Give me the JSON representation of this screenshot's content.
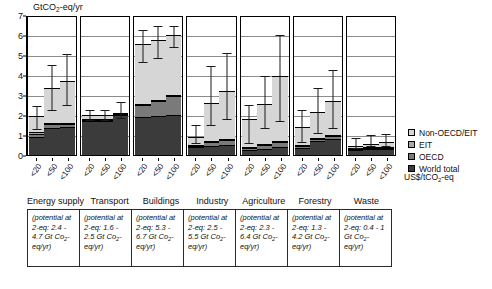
{
  "chart_data": {
    "type": "bar",
    "title": "",
    "ylabel": "GtCO2-eq/yr",
    "xlabel": "US$/tCO2-eq",
    "ylim": [
      0,
      7
    ],
    "yticks": [
      0,
      1,
      2,
      3,
      4,
      5,
      6,
      7
    ],
    "grid": true,
    "legend_position": "right",
    "stacked": true,
    "categories": [
      "<20",
      "<50",
      "<100"
    ],
    "legend": [
      "Non-OECD/EIT",
      "EIT",
      "OECD",
      "World total"
    ],
    "series_colors": {
      "non_oecd_eit": "#d6d6d6",
      "eit": "#a8a8a8",
      "oecd": "#7a7a7a",
      "world_total": "#3b3b3b"
    },
    "panels": [
      {
        "name": "Energy supply",
        "note": "(potential at <US$100/tCO2-eq: 2.4 - 4.7 Gt Co2-eq/yr)",
        "bars": [
          {
            "x": "<20",
            "world_total": 0.9,
            "oecd": 0.15,
            "eit": 0.1,
            "non_oecd_eit": 0.8,
            "total": 1.95,
            "err_low": 1.25,
            "err_high": 2.4
          },
          {
            "x": "<50",
            "world_total": 1.35,
            "oecd": 0.2,
            "eit": 0.05,
            "non_oecd_eit": 1.75,
            "total": 3.35,
            "err_low": 2.2,
            "err_high": 4.45
          },
          {
            "x": "<100",
            "world_total": 1.4,
            "oecd": 0.15,
            "eit": 0.05,
            "non_oecd_eit": 2.1,
            "total": 3.7,
            "err_low": 2.45,
            "err_high": 5.0
          }
        ]
      },
      {
        "name": "Transport",
        "note": "(potential at <US$100/tCO2-eq: 1.6 - 2.5 Gt Co2-eq/yr)",
        "bars": [
          {
            "x": "<20",
            "world_total": 1.7,
            "oecd": 0.05,
            "eit": 0.03,
            "non_oecd_eit": 0.22,
            "total": 2.0,
            "err_low": 1.72,
            "err_high": 2.22
          },
          {
            "x": "<50",
            "world_total": 1.72,
            "oecd": 0.05,
            "eit": 0.03,
            "non_oecd_eit": 0.2,
            "total": 2.0,
            "err_low": 1.72,
            "err_high": 2.22
          },
          {
            "x": "<100",
            "world_total": 2.0,
            "oecd": 0.05,
            "eit": 0.03,
            "non_oecd_eit": 0.0,
            "total": 2.08,
            "err_low": 1.78,
            "err_high": 2.6
          }
        ]
      },
      {
        "name": "Buildings",
        "note": "(potential at <US$100/tCO2-eq: 5.3 - 6.7 Gt Co2-eq/yr)",
        "bars": [
          {
            "x": "<20",
            "world_total": 1.88,
            "oecd": 0.6,
            "eit": 0.05,
            "non_oecd_eit": 3.02,
            "total": 5.55,
            "err_low": 4.62,
            "err_high": 6.22
          },
          {
            "x": "<50",
            "world_total": 1.95,
            "oecd": 0.75,
            "eit": 0.05,
            "non_oecd_eit": 3.0,
            "total": 5.75,
            "err_low": 4.78,
            "err_high": 6.38
          },
          {
            "x": "<100",
            "world_total": 1.98,
            "oecd": 0.95,
            "eit": 0.05,
            "non_oecd_eit": 3.02,
            "total": 6.0,
            "err_low": 5.35,
            "err_high": 6.4
          }
        ]
      },
      {
        "name": "Industry",
        "note": "(potential at <US$100/tCO2-eq: 2.5 - 5.5 Gt Co2-eq/yr)",
        "bars": [
          {
            "x": "<20",
            "world_total": 0.38,
            "oecd": 0.08,
            "eit": 0.04,
            "non_oecd_eit": 0.42,
            "total": 0.92,
            "err_low": 0.55,
            "err_high": 1.45
          },
          {
            "x": "<50",
            "world_total": 0.45,
            "oecd": 0.18,
            "eit": 0.05,
            "non_oecd_eit": 1.92,
            "total": 2.6,
            "err_low": 1.45,
            "err_high": 4.42
          },
          {
            "x": "<100",
            "world_total": 0.48,
            "oecd": 0.25,
            "eit": 0.05,
            "non_oecd_eit": 2.42,
            "total": 3.2,
            "err_low": 1.75,
            "err_high": 5.05
          }
        ]
      },
      {
        "name": "Agriculture",
        "note": "(potential at <US$100/tCO2-eq: 2.3 - 6.4 Gt Co2-eq/yr)",
        "bars": [
          {
            "x": "<20",
            "world_total": 0.25,
            "oecd": 0.1,
            "eit": 0.05,
            "non_oecd_eit": 1.38,
            "total": 1.78,
            "err_low": 0.55,
            "err_high": 2.45
          },
          {
            "x": "<50",
            "world_total": 0.3,
            "oecd": 0.18,
            "eit": 0.05,
            "non_oecd_eit": 2.02,
            "total": 2.55,
            "err_low": 1.32,
            "err_high": 3.88
          },
          {
            "x": "<100",
            "world_total": 0.4,
            "oecd": 0.25,
            "eit": 0.05,
            "non_oecd_eit": 3.25,
            "total": 3.95,
            "err_low": 1.65,
            "err_high": 5.95
          }
        ]
      },
      {
        "name": "Forestry",
        "note": "(potential at <US$100/tCO2-eq: 1.3 - 4.2 Gt Co2-eq/yr)",
        "bars": [
          {
            "x": "<20",
            "world_total": 0.35,
            "oecd": 0.08,
            "eit": 0.05,
            "non_oecd_eit": 0.9,
            "total": 1.38,
            "err_low": 0.62,
            "err_high": 2.18
          },
          {
            "x": "<50",
            "world_total": 0.7,
            "oecd": 0.12,
            "eit": 0.05,
            "non_oecd_eit": 1.28,
            "total": 2.15,
            "err_low": 1.05,
            "err_high": 3.28
          },
          {
            "x": "<100",
            "world_total": 0.82,
            "oecd": 0.15,
            "eit": 0.05,
            "non_oecd_eit": 1.68,
            "total": 2.7,
            "err_low": 1.3,
            "err_high": 4.2
          }
        ]
      },
      {
        "name": "Waste",
        "note": "(potential at <US$100/tCO2-eq: 0.4 - 1 Gt Co2-eq/yr)",
        "bars": [
          {
            "x": "<20",
            "world_total": 0.28,
            "oecd": 0.05,
            "eit": 0.03,
            "non_oecd_eit": 0.1,
            "total": 0.46,
            "err_low": 0.28,
            "err_high": 0.82
          },
          {
            "x": "<50",
            "world_total": 0.3,
            "oecd": 0.06,
            "eit": 0.03,
            "non_oecd_eit": 0.17,
            "total": 0.56,
            "err_low": 0.38,
            "err_high": 0.95
          },
          {
            "x": "<100",
            "world_total": 0.32,
            "oecd": 0.06,
            "eit": 0.03,
            "non_oecd_eit": 0.22,
            "total": 0.63,
            "err_low": 0.42,
            "err_high": 1.02
          }
        ]
      }
    ]
  },
  "axis": {
    "ylabel_main": "GtCO",
    "ylabel_sub": "2",
    "ylabel_tail": "-eq/yr",
    "xunit_main": "US$/tCO",
    "xunit_sub": "2",
    "xunit_tail": "-eq"
  }
}
